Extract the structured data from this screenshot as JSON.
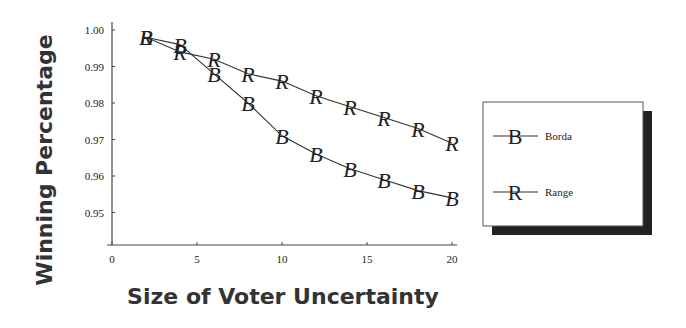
{
  "chart_data": {
    "type": "line",
    "title": "",
    "xlabel": "Size of Voter Uncertainty",
    "ylabel": "Winning Percentage",
    "xlim": [
      0,
      20
    ],
    "ylim": [
      0.94,
      1.0
    ],
    "x_ticks": [
      0,
      5,
      10,
      15,
      20
    ],
    "x_tick_labels": [
      "0",
      "5",
      "10",
      "15",
      "20"
    ],
    "y_ticks": [
      1.0,
      0.99,
      0.98,
      0.97,
      0.96,
      0.95
    ],
    "y_tick_labels": [
      "1.00",
      "0.99",
      "0.98",
      "0.97",
      "0.96",
      "0.95"
    ],
    "grid": false,
    "legend_position": "right",
    "x": [
      2,
      4,
      6,
      8,
      10,
      12,
      14,
      16,
      18,
      20
    ],
    "series": [
      {
        "name": "Borda",
        "marker": "B",
        "values": [
          0.998,
          0.996,
          0.988,
          0.98,
          0.971,
          0.966,
          0.962,
          0.959,
          0.956,
          0.954
        ]
      },
      {
        "name": "Range",
        "marker": "R",
        "values": [
          0.998,
          0.994,
          0.992,
          0.988,
          0.986,
          0.982,
          0.979,
          0.976,
          0.973,
          0.969
        ]
      }
    ]
  },
  "colors": {
    "line": "#333333",
    "axis": "#444444",
    "legend_shadow": "#222222"
  }
}
